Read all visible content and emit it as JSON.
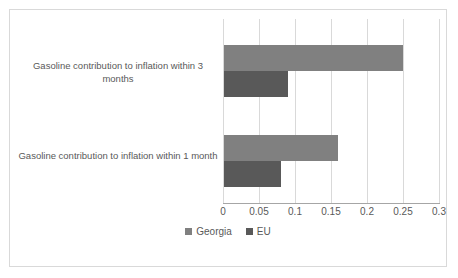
{
  "chart_data": {
    "type": "bar",
    "orientation": "horizontal",
    "title": "",
    "subtitle": "",
    "xlabel": "",
    "ylabel": "",
    "xlim": [
      0,
      0.3
    ],
    "grid": true,
    "legend_position": "bottom",
    "categories": [
      "Gasoline contribution to inflation within 1 month",
      "Gasoline contribution to inflation within 3 months"
    ],
    "series": [
      {
        "name": "Georgia",
        "color": "#808080",
        "values": [
          0.16,
          0.25
        ]
      },
      {
        "name": "EU",
        "color": "#595959",
        "values": [
          0.08,
          0.09
        ]
      }
    ],
    "tick_labels": [
      "0",
      "0.05",
      "0.1",
      "0.15",
      "0.2",
      "0.25",
      "0.3"
    ],
    "tick_values": [
      0,
      0.05,
      0.1,
      0.15,
      0.2,
      0.25,
      0.3
    ]
  },
  "legend": {
    "items": [
      {
        "label": "Georgia",
        "color": "#808080"
      },
      {
        "label": "EU",
        "color": "#595959"
      }
    ]
  },
  "colors": {
    "series_georgia": "#808080",
    "series_eu": "#595959",
    "gridline": "#d9d9d9",
    "axis": "#a6a6a6",
    "text": "#595959",
    "border": "#d9d9d9",
    "background": "#ffffff"
  }
}
